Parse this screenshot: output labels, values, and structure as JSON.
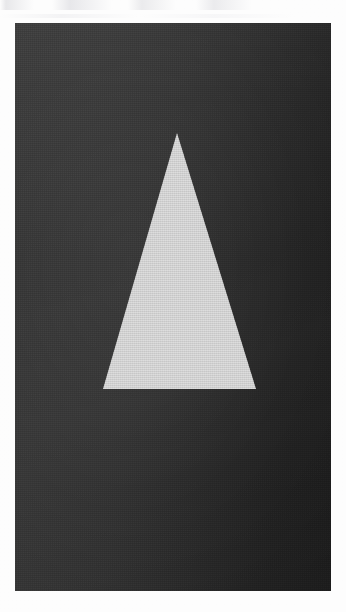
{
  "figure": {
    "kind": "scanned-photograph",
    "caption": "",
    "canvas": {
      "width": 346,
      "height": 612,
      "page_background": "#fdfdfd"
    },
    "panel": {
      "name": "photo-panel",
      "x": 15,
      "y": 23,
      "width": 316,
      "height": 568,
      "background_left": "#383838",
      "background_right": "#1c1c1c",
      "texture": "film-grain"
    },
    "shape": {
      "name": "triangle",
      "type": "isoceles-triangle",
      "fill": "#cacaca",
      "points_page": [
        {
          "label": "apex",
          "x": 177,
          "y": 133
        },
        {
          "label": "base-right",
          "x": 256,
          "y": 389
        },
        {
          "label": "base-left",
          "x": 103,
          "y": 389
        }
      ],
      "base_width": 153,
      "height": 256,
      "orientation": "point-up"
    },
    "margin": {
      "name": "page-margin",
      "color": "#ffffff",
      "top": 23,
      "left": 15,
      "right": 15,
      "bottom": 21
    }
  }
}
